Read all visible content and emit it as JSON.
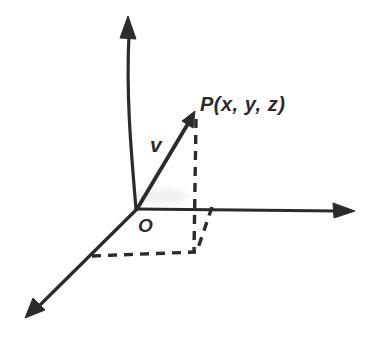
{
  "diagram": {
    "type": "3d-coordinate-system-with-position-vector",
    "labels": {
      "point": "P(x, y, z)",
      "vector": "v",
      "origin": "O"
    },
    "colors": {
      "ink": "#2b2b2b",
      "background": "#ffffff"
    }
  }
}
